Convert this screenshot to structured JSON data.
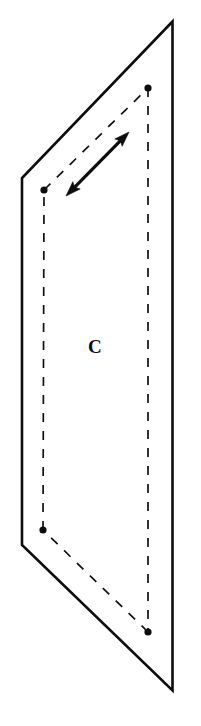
{
  "figure": {
    "background_color": "#ffffff",
    "stroke_color": "#0d0d0d",
    "canvas": {
      "width": 201,
      "height": 726
    },
    "label": {
      "text": "C",
      "x": 88,
      "y": 337,
      "font_size": 19,
      "weight": "bold",
      "style": "serif"
    },
    "plane_outline": {
      "name": "plane-c-outline",
      "stroke_width": 2.6,
      "style": "solid",
      "points": [
        {
          "name": "top-right-apex",
          "x": 172.5,
          "y": 21.5
        },
        {
          "name": "top-left-corner",
          "x": 22.0,
          "y": 178.0
        },
        {
          "name": "bottom-left-corner",
          "x": 22.0,
          "y": 545.0
        },
        {
          "name": "bottom-right-apex",
          "x": 172.5,
          "y": 690.5
        },
        {
          "name": "right-edge-top",
          "x": 172.5,
          "y": 21.5
        }
      ],
      "path": "M 172.5 21.5 L 22 178 L 22 545 L 172.5 690.5 L 172.5 21.5 Z"
    },
    "dashed_quad": {
      "name": "dashed-inner-quadrilateral",
      "stroke_width": 1.7,
      "dash_pattern": "9 9",
      "vertices": [
        {
          "name": "dot-top-left",
          "x": 44.0,
          "y": 190.0
        },
        {
          "name": "dot-top-right",
          "x": 148.0,
          "y": 88.0
        },
        {
          "name": "dot-bottom-right",
          "x": 148.0,
          "y": 632.0
        },
        {
          "name": "dot-bottom-left",
          "x": 43.0,
          "y": 530.0
        }
      ],
      "edges": [
        {
          "name": "dashed-edge-top",
          "x1": 44.0,
          "y1": 190.0,
          "x2": 148.0,
          "y2": 88.0
        },
        {
          "name": "dashed-edge-right",
          "x1": 148.0,
          "y1": 88.0,
          "x2": 148.0,
          "y2": 632.0
        },
        {
          "name": "dashed-edge-bottom",
          "x1": 148.0,
          "y1": 632.0,
          "x2": 43.0,
          "y2": 530.0
        },
        {
          "name": "dashed-edge-left",
          "x1": 43.0,
          "y1": 530.0,
          "x2": 44.0,
          "y2": 190.0
        }
      ],
      "dot_radius": 3.6
    },
    "arrow": {
      "name": "double-headed-arrow",
      "style": "double-headed",
      "stroke_width": 3.2,
      "head_length": 15,
      "head_half_width": 5.2,
      "start": {
        "x": 66.0,
        "y": 196.0
      },
      "end": {
        "x": 129.0,
        "y": 132.0
      }
    }
  }
}
